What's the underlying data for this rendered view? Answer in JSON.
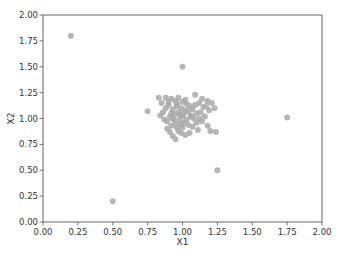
{
  "chart_data": {
    "type": "scatter",
    "title": "",
    "xlabel": "X1",
    "ylabel": "X2",
    "xlim": [
      0.0,
      2.0
    ],
    "ylim": [
      0.0,
      2.0
    ],
    "xticks": [
      "0.00",
      "0.25",
      "0.50",
      "0.75",
      "1.00",
      "1.25",
      "1.50",
      "1.75",
      "2.00"
    ],
    "yticks": [
      "0.00",
      "0.25",
      "0.50",
      "0.75",
      "1.00",
      "1.25",
      "1.50",
      "1.75",
      "2.00"
    ],
    "grid": false,
    "legend": null,
    "marker_color": "#a9a9a9",
    "series": [
      {
        "name": "points",
        "points": [
          [
            0.2,
            1.8
          ],
          [
            1.0,
            1.5
          ],
          [
            1.75,
            1.01
          ],
          [
            1.25,
            0.5
          ],
          [
            0.5,
            0.2
          ],
          [
            0.75,
            1.07
          ],
          [
            0.83,
            1.2
          ],
          [
            0.88,
            1.2
          ],
          [
            0.92,
            1.19
          ],
          [
            0.95,
            1.17
          ],
          [
            0.97,
            1.2
          ],
          [
            1.0,
            1.16
          ],
          [
            1.03,
            1.14
          ],
          [
            1.05,
            1.12
          ],
          [
            1.09,
            1.23
          ],
          [
            1.12,
            1.15
          ],
          [
            1.14,
            1.19
          ],
          [
            1.18,
            1.17
          ],
          [
            1.21,
            1.15
          ],
          [
            1.23,
            1.1
          ],
          [
            1.19,
            1.08
          ],
          [
            1.15,
            1.11
          ],
          [
            1.1,
            1.05
          ],
          [
            1.08,
            1.0
          ],
          [
            1.06,
            1.03
          ],
          [
            1.02,
            1.08
          ],
          [
            0.99,
            1.1
          ],
          [
            0.96,
            1.12
          ],
          [
            0.93,
            1.09
          ],
          [
            0.9,
            1.13
          ],
          [
            0.86,
            1.06
          ],
          [
            0.84,
            1.03
          ],
          [
            0.87,
            0.99
          ],
          [
            0.89,
            0.97
          ],
          [
            0.91,
            1.02
          ],
          [
            0.94,
            1.04
          ],
          [
            0.97,
            1.06
          ],
          [
            1.0,
            1.02
          ],
          [
            1.03,
            0.99
          ],
          [
            1.01,
            0.96
          ],
          [
            0.98,
            0.98
          ],
          [
            0.95,
            0.95
          ],
          [
            0.92,
            0.93
          ],
          [
            0.89,
            0.9
          ],
          [
            0.91,
            0.87
          ],
          [
            0.93,
            0.83
          ],
          [
            0.95,
            0.8
          ],
          [
            0.97,
            0.88
          ],
          [
            1.0,
            0.91
          ],
          [
            1.04,
            0.94
          ],
          [
            1.07,
            0.92
          ],
          [
            1.1,
            0.96
          ],
          [
            1.12,
            1.0
          ],
          [
            1.14,
            0.97
          ],
          [
            1.16,
            1.02
          ],
          [
            1.18,
            0.93
          ],
          [
            1.2,
            0.88
          ],
          [
            1.24,
            0.87
          ],
          [
            1.11,
            0.89
          ],
          [
            1.05,
            0.86
          ],
          [
            1.02,
            0.84
          ],
          [
            0.99,
            0.86
          ],
          [
            0.96,
            0.91
          ],
          [
            0.94,
            0.99
          ],
          [
            0.92,
            1.05
          ],
          [
            0.98,
            1.03
          ],
          [
            1.01,
            1.05
          ],
          [
            1.04,
            1.07
          ],
          [
            1.07,
            1.09
          ],
          [
            1.09,
            1.13
          ],
          [
            0.88,
            1.1
          ],
          [
            0.85,
            1.15
          ],
          [
            0.9,
            1.16
          ],
          [
            0.96,
            1.14
          ],
          [
            1.02,
            1.18
          ],
          [
            1.06,
            1.02
          ],
          [
            1.13,
            1.06
          ],
          [
            1.17,
            1.12
          ],
          [
            0.93,
            1.0
          ],
          [
            0.99,
            0.94
          ]
        ]
      }
    ]
  }
}
